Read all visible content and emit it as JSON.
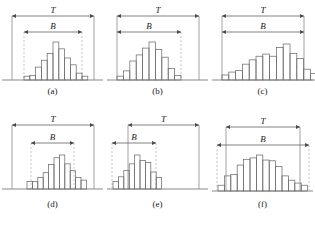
{
  "figure": {
    "title_caption": "",
    "label_T": "T",
    "label_B": "B",
    "colors": {
      "bar_stroke": "#6e6e6e",
      "axis": "#8a8a8a",
      "arrow": "#4a4a4a",
      "dashed": "#b9b9b9",
      "text": "#1b1b1b",
      "background": "#ffffff"
    },
    "panels": [
      {
        "id": "a",
        "caption": "(a)",
        "T_label": "T",
        "B_label": "B",
        "T_start": 12,
        "T_end": 94,
        "B_start": 24,
        "B_end": 82,
        "baseline_y": 80,
        "T_arrow_y": 16,
        "B_arrow_y": 32,
        "bar_left": 24,
        "bar_width": 5.8,
        "max_bar_height": 38,
        "values": [
          0.1,
          0.12,
          0.34,
          0.52,
          0.7,
          1.0,
          0.82,
          0.58,
          0.4,
          0.18,
          0.1
        ]
      },
      {
        "id": "b",
        "caption": "(b)",
        "T_label": "T",
        "B_label": "B",
        "T_start": 12,
        "T_end": 94,
        "B_start": 12,
        "B_end": 76,
        "baseline_y": 80,
        "T_arrow_y": 16,
        "B_arrow_y": 32,
        "bar_left": 12,
        "bar_width": 6.4,
        "max_bar_height": 38,
        "values": [
          0.1,
          0.24,
          0.5,
          0.66,
          0.84,
          1.0,
          0.8,
          0.6,
          0.3,
          0.12
        ]
      },
      {
        "id": "c",
        "caption": "(c)",
        "T_label": "T",
        "B_label": "B",
        "T_start": 12,
        "T_end": 94,
        "B_start": 12,
        "B_end": 94,
        "baseline_y": 80,
        "T_arrow_y": 16,
        "B_arrow_y": 32,
        "bar_left": 12,
        "bar_width": 6.8,
        "max_bar_height": 36,
        "values": [
          0.14,
          0.22,
          0.26,
          0.44,
          0.56,
          0.66,
          0.72,
          0.66,
          0.9,
          1.0,
          0.74,
          0.6,
          0.3,
          0.18,
          0.16
        ]
      },
      {
        "id": "d",
        "caption": "(d)",
        "T_label": "T",
        "B_label": "B",
        "T_start": 12,
        "T_end": 94,
        "B_start": 31,
        "B_end": 74,
        "baseline_y": 82,
        "T_arrow_y": 18,
        "B_arrow_y": 36,
        "bar_left": 27,
        "bar_width": 5.4,
        "max_bar_height": 34,
        "values": [
          0.22,
          0.22,
          0.34,
          0.48,
          0.72,
          0.92,
          1.0,
          0.74,
          0.54,
          0.34,
          0.26
        ]
      },
      {
        "id": "e",
        "caption": "(e)",
        "T_label": "T",
        "B_label": "B",
        "T_start": 23,
        "T_end": 94,
        "B_start": 7,
        "B_end": 51,
        "baseline_y": 82,
        "T_arrow_y": 18,
        "B_arrow_y": 36,
        "bar_left": 8,
        "bar_width": 5.4,
        "max_bar_height": 34,
        "values": [
          0.22,
          0.36,
          0.54,
          0.74,
          1.0,
          0.84,
          0.78,
          0.5,
          0.34
        ]
      },
      {
        "id": "f",
        "caption": "(f)",
        "T_label": "T",
        "B_label": "B",
        "T_start": 16,
        "T_end": 90,
        "B_start": 7,
        "B_end": 99,
        "baseline_y": 84,
        "T_arrow_y": 20,
        "B_arrow_y": 38,
        "bar_left": 8,
        "bar_width": 6.4,
        "max_bar_height": 36,
        "values": [
          0.16,
          0.42,
          0.46,
          0.72,
          0.88,
          0.92,
          1.0,
          0.86,
          0.84,
          0.68,
          0.42,
          0.3,
          0.22,
          0.16
        ]
      }
    ]
  },
  "chart_data": {
    "type": "bar",
    "xlabel": "",
    "ylabel": "",
    "grid": false,
    "legend": null,
    "annotations": [
      "T",
      "B"
    ],
    "panels": [
      {
        "name": "(a)",
        "categories": [
          "1",
          "2",
          "3",
          "4",
          "5",
          "6",
          "7",
          "8",
          "9",
          "10",
          "11"
        ],
        "values": [
          0.1,
          0.12,
          0.34,
          0.52,
          0.7,
          1.0,
          0.82,
          0.58,
          0.4,
          0.18,
          0.1
        ],
        "T_span": "full width, arrows both ends",
        "B_span": "inner width, narrower than T, centered"
      },
      {
        "name": "(b)",
        "categories": [
          "1",
          "2",
          "3",
          "4",
          "5",
          "6",
          "7",
          "8",
          "9",
          "10"
        ],
        "values": [
          0.1,
          0.24,
          0.5,
          0.66,
          0.84,
          1.0,
          0.8,
          0.6,
          0.3,
          0.12
        ],
        "T_span": "full width",
        "B_span": "left-aligned, shorter than T"
      },
      {
        "name": "(c)",
        "categories": [
          "1",
          "2",
          "3",
          "4",
          "5",
          "6",
          "7",
          "8",
          "9",
          "10",
          "11",
          "12",
          "13",
          "14",
          "15"
        ],
        "values": [
          0.14,
          0.22,
          0.26,
          0.44,
          0.56,
          0.66,
          0.72,
          0.66,
          0.9,
          1.0,
          0.74,
          0.6,
          0.3,
          0.18,
          0.16
        ],
        "T_span": "full width",
        "B_span": "equal to T"
      },
      {
        "name": "(d)",
        "categories": [
          "1",
          "2",
          "3",
          "4",
          "5",
          "6",
          "7",
          "8",
          "9",
          "10",
          "11"
        ],
        "values": [
          0.22,
          0.22,
          0.34,
          0.48,
          0.72,
          0.92,
          1.0,
          0.74,
          0.54,
          0.34,
          0.26
        ],
        "T_span": "full width",
        "B_span": "narrow, centered"
      },
      {
        "name": "(e)",
        "categories": [
          "1",
          "2",
          "3",
          "4",
          "5",
          "6",
          "7",
          "8",
          "9"
        ],
        "values": [
          0.22,
          0.36,
          0.54,
          0.74,
          1.0,
          0.84,
          0.78,
          0.5,
          0.34
        ],
        "T_span": "full width, offset right start",
        "B_span": "very narrow, far left"
      },
      {
        "name": "(f)",
        "categories": [
          "1",
          "2",
          "3",
          "4",
          "5",
          "6",
          "7",
          "8",
          "9",
          "10",
          "11",
          "12",
          "13",
          "14"
        ],
        "values": [
          0.16,
          0.42,
          0.46,
          0.72,
          0.88,
          0.92,
          1.0,
          0.86,
          0.84,
          0.68,
          0.42,
          0.3,
          0.22,
          0.16
        ],
        "T_span": "inner width",
        "B_span": "wider than T, extends past both ends"
      }
    ]
  }
}
